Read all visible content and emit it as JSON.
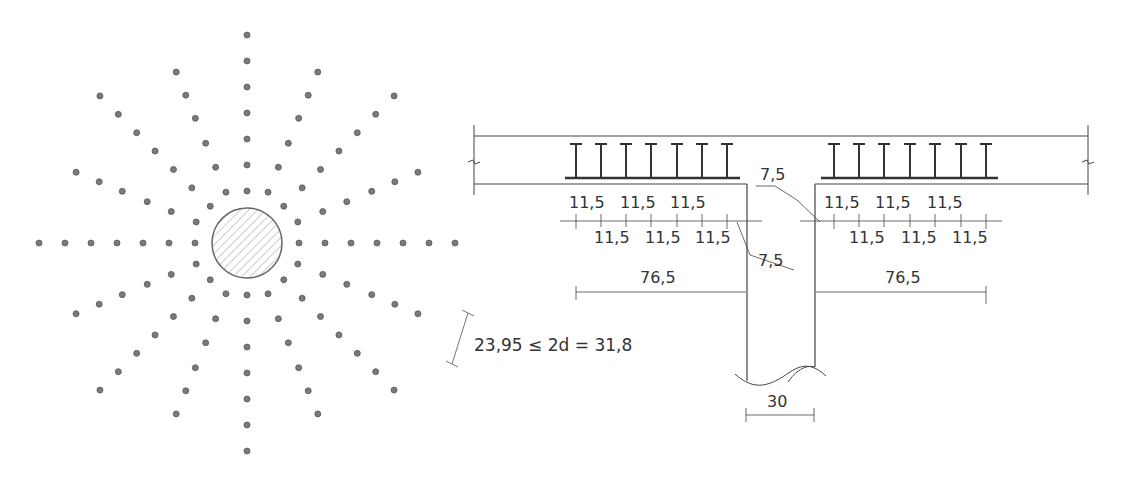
{
  "plan_view": {
    "column": {
      "cx": 247,
      "cy": 243,
      "r": 35,
      "hatch": "diagonal"
    },
    "stud_rails": {
      "count": 16,
      "angle_step_deg": 22.5,
      "dot_color": "#7a7a7a",
      "axis_rails": {
        "radii": [
          52,
          78,
          104,
          130,
          156,
          182,
          208
        ]
      },
      "diagonal_rails": {
        "radii": [
          52,
          78,
          104,
          130,
          156,
          182,
          208
        ]
      },
      "intermediate_rails": {
        "radii": [
          55,
          82,
          108,
          135,
          160,
          185
        ]
      }
    },
    "spacing_label": "23,95 ≤ 2d = 31,8"
  },
  "section_view": {
    "top_slab_labels": {
      "left": {
        "upper": [
          "11,5",
          "11,5",
          "11,5"
        ],
        "lower": [
          "11,5",
          "11,5",
          "11,5"
        ],
        "total": "76,5"
      },
      "right": {
        "upper": [
          "11,5",
          "11,5",
          "11,5"
        ],
        "lower": [
          "11,5",
          "11,5",
          "11,5"
        ],
        "total": "76,5"
      }
    },
    "first_stud_offset_left": "7,5",
    "first_stud_offset_right": "7,5",
    "column_width": "30"
  }
}
